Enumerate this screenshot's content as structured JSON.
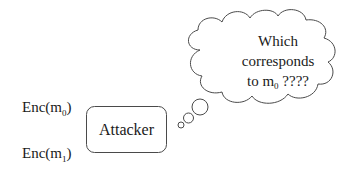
{
  "diagram": {
    "inputs": [
      {
        "prefix": "Enc(m",
        "subscript": "0",
        "suffix": ")"
      },
      {
        "prefix": "Enc(m",
        "subscript": "1",
        "suffix": ")"
      }
    ],
    "attacker": {
      "label": "Attacker"
    },
    "thought_bubble": {
      "line1": "Which",
      "line2": "corresponds",
      "line3_prefix": "to m",
      "line3_subscript": "0",
      "line3_suffix": " ????"
    },
    "colors": {
      "stroke": "#4a4a4a",
      "text": "#1a1a1a",
      "background": "#ffffff"
    }
  }
}
